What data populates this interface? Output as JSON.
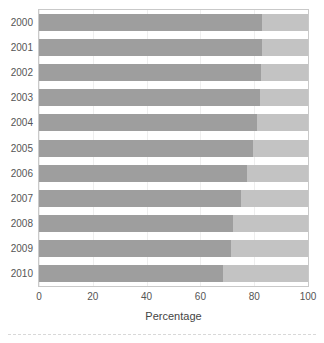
{
  "chart_data": {
    "type": "bar",
    "orientation": "horizontal",
    "stacked": true,
    "title": "",
    "subtitle": "",
    "xlabel": "Percentage",
    "ylabel": "",
    "xlim": [
      0,
      100
    ],
    "xticks": [
      0,
      20,
      40,
      60,
      80,
      100
    ],
    "xtick_labels": [
      "0",
      "20",
      "40",
      "60",
      "80",
      "100"
    ],
    "grid": true,
    "grid_axis": "x",
    "legend": false,
    "legend_position": "none",
    "categories": [
      "2000",
      "2001",
      "2002",
      "2003",
      "2004",
      "2005",
      "2006",
      "2007",
      "2008",
      "2009",
      "2010"
    ],
    "series": [
      {
        "name": "primary",
        "color": "#9e9e9e",
        "values": [
          83,
          83,
          82.5,
          82,
          81,
          79.5,
          77.5,
          75,
          72,
          71.5,
          68.5
        ]
      },
      {
        "name": "secondary",
        "color": "#c3c3c3",
        "values": [
          17,
          17,
          17.5,
          18,
          19,
          20.5,
          22.5,
          25,
          28,
          28.5,
          31.5
        ]
      }
    ],
    "annotations": []
  },
  "axis": {
    "x_title": "Percentage",
    "tick_labels": [
      "0",
      "20",
      "40",
      "60",
      "80",
      "100"
    ],
    "year_labels": [
      "2000",
      "2001",
      "2002",
      "2003",
      "2004",
      "2005",
      "2006",
      "2007",
      "2008",
      "2009",
      "2010"
    ]
  },
  "colors": {
    "primary_segment": "#9e9e9e",
    "secondary_segment": "#c3c3c3",
    "gridline": "#eeeeee",
    "frame": "#c9c9c9",
    "label_text": "#555555",
    "axis_title_text": "#444444",
    "background": "#ffffff"
  }
}
